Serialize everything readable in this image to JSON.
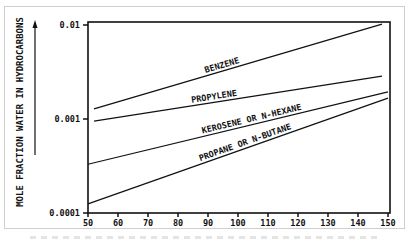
{
  "chart_data": {
    "type": "line",
    "title": "",
    "xlabel": "",
    "ylabel": "MOLE FRACTION WATER IN HYDROCARBONS",
    "xlim": [
      50,
      150
    ],
    "ylim": [
      0.0001,
      0.01
    ],
    "yscale": "log",
    "x_ticks": [
      "50",
      "60",
      "70",
      "80",
      "90",
      "100",
      "110",
      "120",
      "130",
      "140",
      "150"
    ],
    "x_tick_values": [
      50,
      60,
      70,
      80,
      90,
      100,
      110,
      120,
      130,
      140,
      150
    ],
    "y_ticks": [
      "0.0001",
      "0.001",
      "0.01"
    ],
    "y_tick_values": [
      0.0001,
      0.001,
      0.01
    ],
    "grid": false,
    "series": [
      {
        "name": "BENZENE",
        "x": [
          52,
          148
        ],
        "y": [
          0.00128,
          0.0102
        ]
      },
      {
        "name": "PROPYLENE",
        "x": [
          52,
          148
        ],
        "y": [
          0.00095,
          0.00286
        ]
      },
      {
        "name": "KEROSENE OR N-HEXANE",
        "x": [
          50,
          150
        ],
        "y": [
          0.00033,
          0.00194
        ]
      },
      {
        "name": "PROPANE OR N-BUTANE",
        "x": [
          50,
          150
        ],
        "y": [
          0.000125,
          0.00167
        ]
      }
    ]
  }
}
